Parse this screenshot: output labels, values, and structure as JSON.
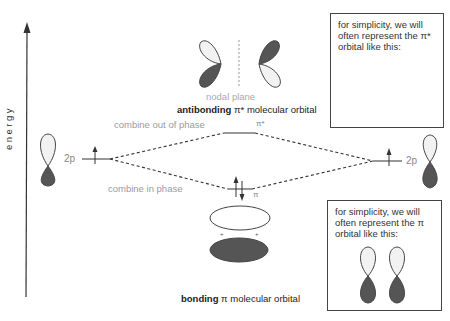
{
  "axis": {
    "label": "energy"
  },
  "levels": {
    "left_ao": {
      "label": "2p",
      "electrons": "up"
    },
    "right_ao": {
      "label": "2p",
      "electrons": "up"
    },
    "antibonding": {
      "label": "π*",
      "electrons": "none"
    },
    "bonding": {
      "label": "π",
      "electrons": "up-down"
    }
  },
  "annotations": {
    "out_of_phase": "combine out of phase",
    "in_phase": "combine in phase",
    "nodal_plane": "nodal plane",
    "antibonding_title_bold": "antibonding",
    "antibonding_title_rest": " π* molecular orbital",
    "bonding_title_bold": "bonding",
    "bonding_title_rest": " π molecular orbital"
  },
  "boxes": {
    "top": {
      "text": "for simplicity, we will often represent the π* orbital like this:"
    },
    "bottom": {
      "text": "for simplicity, we will often represent the π orbital like this:"
    }
  },
  "colors": {
    "shaded_lobe": "#555555",
    "light_lobe": "#f2f2f2",
    "outline": "#444444",
    "dashed_line": "#333333",
    "label_gray": "#9a9a9a"
  }
}
